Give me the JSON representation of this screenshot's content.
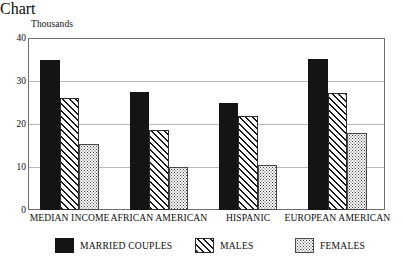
{
  "chart_data": {
    "type": "bar",
    "title": "",
    "unit_caption": "Thousands",
    "xlabel": "",
    "ylabel": "",
    "ylim": [
      0,
      40
    ],
    "yticks": [
      0,
      10,
      20,
      30,
      40
    ],
    "ytick_labels": [
      "0",
      "10",
      "20",
      "30",
      "40"
    ],
    "grid": true,
    "legend_position": "bottom",
    "categories": [
      "MEDIAN INCOME",
      "AFRICAN AMERICAN",
      "HISPANIC",
      "EUROPEAN AMERICAN"
    ],
    "series": [
      {
        "name": "MARRIED COUPLES",
        "pattern": "solid-black",
        "values": [
          34.8,
          27.4,
          25.0,
          35.1
        ]
      },
      {
        "name": "MALES",
        "pattern": "diagonal-hatch",
        "values": [
          26.1,
          18.7,
          21.8,
          27.2
        ]
      },
      {
        "name": "FEMALES",
        "pattern": "stipple-dots",
        "values": [
          15.4,
          10.1,
          10.5,
          17.8
        ]
      }
    ],
    "colors": {
      "married_couples": "#141414",
      "males": "#1a1a1a",
      "females": "#3d3d3d",
      "frame": "#6f6f6f",
      "gridline": "#b9b9b9",
      "background": "#ffffff"
    }
  },
  "legend": {
    "items": [
      {
        "label": "MARRIED COUPLES",
        "swatch": "solid-black-swatch"
      },
      {
        "label": "MALES",
        "swatch": "diagonal-hatch-swatch"
      },
      {
        "label": "FEMALES",
        "swatch": "stipple-dots-swatch"
      }
    ]
  }
}
